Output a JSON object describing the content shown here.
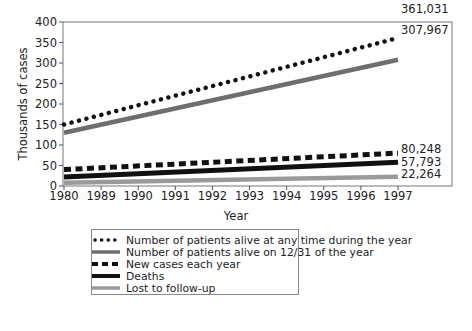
{
  "chart_data": {
    "type": "line",
    "title": "",
    "xlabel": "Year",
    "ylabel": "Thousands of cases",
    "ylim": [
      0,
      400
    ],
    "yticks": [
      0,
      50,
      100,
      150,
      200,
      250,
      300,
      350,
      400
    ],
    "categories": [
      "1980",
      "1989",
      "1990",
      "1991",
      "1992",
      "1993",
      "1994",
      "1995",
      "1996",
      "1997"
    ],
    "grid": false,
    "legend_position": "bottom",
    "series": [
      {
        "name": "Number of patients alive at any time during the year",
        "style": "dotted",
        "color": "#111111",
        "start": 150,
        "end": 361.031,
        "end_label": "361,031"
      },
      {
        "name": "Number of patients alive on 12/31 of the year",
        "style": "solid-thick",
        "color": "#6e6e6e",
        "start": 130,
        "end": 307.967,
        "end_label": "307,967"
      },
      {
        "name": "New cases each year",
        "style": "dashed",
        "color": "#111111",
        "start": 40,
        "end": 80.248,
        "end_label": "80,248"
      },
      {
        "name": "Deaths",
        "style": "solid-thick",
        "color": "#111111",
        "start": 22,
        "end": 57.793,
        "end_label": "57,793"
      },
      {
        "name": "Lost to follow-up",
        "style": "solid-thick",
        "color": "#9a9a9a",
        "start": 8,
        "end": 22.264,
        "end_label": "22,264"
      }
    ]
  },
  "legend": {
    "items": [
      "Number of patients alive at any time during the year",
      "Number of patients alive on 12/31 of the year",
      "New cases each year",
      "Deaths",
      "Lost to follow-up"
    ]
  }
}
